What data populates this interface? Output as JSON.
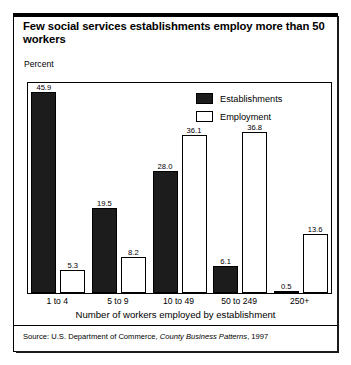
{
  "title": "Few social services establishments employ more than 50 workers",
  "axis": {
    "y_unit_label": "Percent",
    "x_title": "Number of workers employed by establishment"
  },
  "legend": {
    "position": "top-right",
    "entries": [
      {
        "label": "Establishments",
        "swatch": "filled-black-square-icon"
      },
      {
        "label": "Employment",
        "swatch": "hollow-white-square-icon"
      }
    ]
  },
  "source": {
    "prefix": "Source: U.S. Department of Commerce,",
    "publication": "County Business Patterns",
    "suffix": ", 1997"
  },
  "chart_data": {
    "type": "bar",
    "title": "Few social services establishments employ more than 50 workers",
    "xlabel": "Number of workers employed by establishment",
    "ylabel": "Percent",
    "ylim": [
      0,
      48
    ],
    "grid": false,
    "legend_position": "top-right",
    "categories": [
      "1 to 4",
      "5 to 9",
      "10 to 49",
      "50 to 249",
      "250+"
    ],
    "series": [
      {
        "name": "Establishments",
        "color": "#1c1c1c",
        "values": [
          45.9,
          19.5,
          28.0,
          6.1,
          0.5
        ],
        "labels": [
          "45.9",
          "19.5",
          "28.0",
          "6.1",
          "0.5"
        ]
      },
      {
        "name": "Employment",
        "color": "#ffffff",
        "values": [
          5.3,
          8.2,
          36.1,
          36.8,
          13.6
        ],
        "labels": [
          "5.3",
          "8.2",
          "36.1",
          "36.8",
          "13.6"
        ]
      }
    ]
  }
}
